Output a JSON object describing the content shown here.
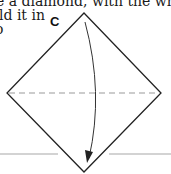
{
  "text": {
    "line1": "e a diamond, with the white",
    "line2": "ld it in",
    "line3": "o"
  },
  "diagram": {
    "step_label": "C",
    "shape": "diamond",
    "vertices": {
      "top": [
        84,
        13
      ],
      "right": [
        161,
        93
      ],
      "bottom": [
        84,
        172
      ],
      "left": [
        7,
        93
      ]
    },
    "fold_line": {
      "style": "dashed",
      "y": 93,
      "x1": 7,
      "x2": 161,
      "color": "#9a9a9a"
    },
    "arrow": {
      "style": "curved",
      "start": [
        85,
        22
      ],
      "control": [
        102,
        93
      ],
      "end": [
        89,
        162
      ],
      "head": "filled"
    },
    "baseline": {
      "y": 154,
      "segments": [
        [
          0,
          58
        ],
        [
          109,
          171
        ]
      ],
      "color": "#c4c4c4"
    },
    "colors": {
      "outline": "#222222",
      "dashed": "#9a9a9a",
      "baseline": "#c4c4c4"
    }
  }
}
